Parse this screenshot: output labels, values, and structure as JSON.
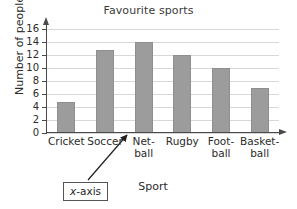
{
  "chart_data": {
    "type": "bar",
    "title": "Favourite sports",
    "xlabel": "Sport",
    "ylabel": "Number of people",
    "categories": [
      "Cricket",
      "Soccer",
      "Net-\nball",
      "Rugby",
      "Foot-\nball",
      "Basket-\nball"
    ],
    "values": [
      4.7,
      12.8,
      14,
      12,
      10,
      7
    ],
    "ylim": [
      0,
      16
    ],
    "yticks": [
      0,
      2,
      4,
      6,
      8,
      10,
      12,
      14,
      16
    ],
    "ytick_labels": [
      "0",
      "2",
      "4",
      "6",
      "8",
      "10",
      "12",
      "14",
      "16"
    ],
    "grid": true,
    "legend": false,
    "annotations": [
      {
        "text_italic": "x",
        "text_rest": "-axis",
        "full_text": "x-axis",
        "points_to": "x-axis-line"
      }
    ],
    "colors": {
      "bar_fill": "#9c9c9c",
      "bar_edge": "#8f8f8f",
      "gridline": "#d8d8d8",
      "axis": "#4a4a4a",
      "text": "#2b2b2b",
      "background": "#ffffff"
    }
  }
}
